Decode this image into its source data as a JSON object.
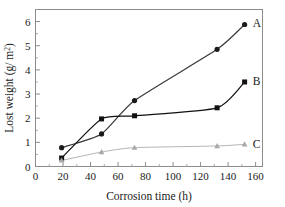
{
  "chart_data": {
    "type": "line",
    "title": "",
    "subtitle": "",
    "xlabel": "Corrosion time (h)",
    "ylabel": "Lost weight (g/m2)",
    "ylabel_base": "Lost weight (g/ m",
    "ylabel_sup": "2",
    "ylabel_close": ")",
    "xlim": [
      0,
      165
    ],
    "ylim": [
      0,
      6.5
    ],
    "xticks": [
      0,
      20,
      40,
      60,
      80,
      100,
      120,
      140,
      160
    ],
    "yticks": [
      0,
      1,
      2,
      3,
      4,
      5,
      6
    ],
    "xtick_labels": [
      "0",
      "20",
      "40",
      "60",
      "80",
      "100",
      "120",
      "140",
      "160"
    ],
    "ytick_labels": [
      "0",
      "1",
      "2",
      "3",
      "4",
      "5",
      "6"
    ],
    "x_minor_step": 10,
    "y_minor_step": 0.5,
    "grid": false,
    "legend_position": "inline-right-of-curve-ends",
    "frame": "box",
    "tick_direction": "in",
    "series": [
      {
        "name": "A",
        "label": "A",
        "marker": "circle",
        "color": "#1a1a1a",
        "line_color": "#3a3a3a",
        "x": [
          19,
          48,
          72,
          132,
          152
        ],
        "values": [
          0.78,
          1.35,
          2.73,
          4.85,
          5.88
        ],
        "label_x": 158,
        "label_y": 5.95
      },
      {
        "name": "B",
        "label": "B",
        "marker": "square",
        "color": "#111111",
        "line_color": "#111111",
        "x": [
          19,
          48,
          72,
          132,
          152
        ],
        "values": [
          0.35,
          1.97,
          2.1,
          2.43,
          3.5
        ],
        "label_x": 158,
        "label_y": 3.55
      },
      {
        "name": "C",
        "label": "C",
        "marker": "triangle",
        "color": "#a8a8a8",
        "line_color": "#b4b4b4",
        "x": [
          19,
          48,
          72,
          132,
          152
        ],
        "values": [
          0.25,
          0.6,
          0.78,
          0.85,
          0.92
        ],
        "label_x": 158,
        "label_y": 0.95
      }
    ]
  },
  "axes": {
    "x_title": "Corrosion time (h)",
    "y_title_prefix": "Lost weight (g/ m",
    "y_title_sup": "2",
    "y_title_suffix": ")"
  },
  "ticks": {
    "x": [
      "0",
      "20",
      "40",
      "60",
      "80",
      "100",
      "120",
      "140",
      "160"
    ],
    "y": [
      "0",
      "1",
      "2",
      "3",
      "4",
      "5",
      "6"
    ]
  },
  "labels": {
    "a": "A",
    "b": "B",
    "c": "C"
  }
}
